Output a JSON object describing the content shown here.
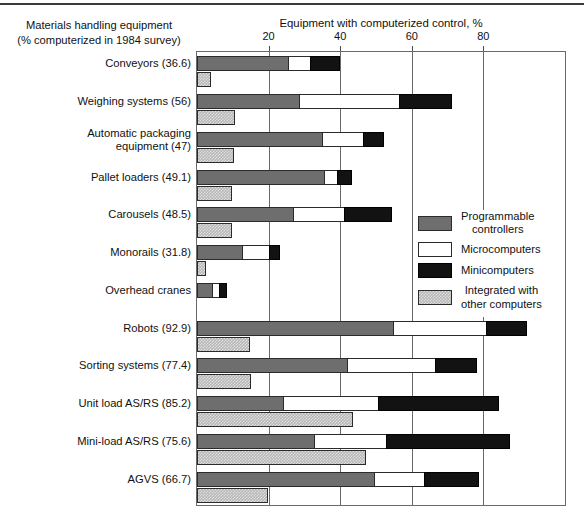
{
  "chart_data": {
    "type": "bar",
    "orientation": "horizontal",
    "stacked": true,
    "title": "",
    "xlabel": "Equipment with computerized control, %",
    "ylabel": "Materials handling equipment\n(% computerized in 1984 survey)",
    "ylabel_line1": "Materials handling equipment",
    "ylabel_line2": "(% computerized in 1984 survey)",
    "xlim": [
      0,
      102.8
    ],
    "xticks": [
      20,
      40,
      60,
      80
    ],
    "xticklabels": [
      "20",
      "40",
      "60",
      "80"
    ],
    "grid": true,
    "legend_position": "right-middle",
    "legend": [
      {
        "name": "Programmable controllers",
        "label_line1": "Programmable",
        "label_line2": "controllers",
        "color": "#6e6e6e",
        "swatch": "pc"
      },
      {
        "name": "Microcomputers",
        "label_line1": "Microcomputers",
        "label_line2": "",
        "color": "#ffffff",
        "swatch": "micro"
      },
      {
        "name": "Minicomputers",
        "label_line1": "Minicomputers",
        "label_line2": "",
        "color": "#121212",
        "swatch": "mini"
      },
      {
        "name": "Integrated with other computers",
        "label_line1": "Integrated with",
        "label_line2": "other computers",
        "color": "#b6b6b6",
        "swatch": "int"
      }
    ],
    "categories": [
      {
        "label_line1": "Conveyors (36.6)",
        "label_line2": "",
        "name": "Conveyors",
        "pct_computerized": 36.6
      },
      {
        "label_line1": "Weighing systems (56)",
        "label_line2": "",
        "name": "Weighing systems",
        "pct_computerized": 56
      },
      {
        "label_line1": "Automatic packaging",
        "label_line2": "equipment (47)",
        "name": "Automatic packaging equipment",
        "pct_computerized": 47
      },
      {
        "label_line1": "Pallet loaders (49.1)",
        "label_line2": "",
        "name": "Pallet loaders",
        "pct_computerized": 49.1
      },
      {
        "label_line1": "Carousels (48.5)",
        "label_line2": "",
        "name": "Carousels",
        "pct_computerized": 48.5
      },
      {
        "label_line1": "Monorails (31.8)",
        "label_line2": "",
        "name": "Monorails",
        "pct_computerized": 31.8
      },
      {
        "label_line1": "Overhead cranes",
        "label_line2": "",
        "name": "Overhead cranes",
        "pct_computerized": null
      },
      {
        "label_line1": "Robots (92.9)",
        "label_line2": "",
        "name": "Robots",
        "pct_computerized": 92.9
      },
      {
        "label_line1": "Sorting systems (77.4)",
        "label_line2": "",
        "name": "Sorting systems",
        "pct_computerized": 77.4
      },
      {
        "label_line1": "Unit load AS/RS (85.2)",
        "label_line2": "",
        "name": "Unit load AS/RS",
        "pct_computerized": 85.2
      },
      {
        "label_line1": "Mini-load AS/RS (75.6)",
        "label_line2": "",
        "name": "Mini-load AS/RS",
        "pct_computerized": 75.6
      },
      {
        "label_line1": "AGVS (66.7)",
        "label_line2": "",
        "name": "AGVS",
        "pct_computerized": 66.7
      }
    ],
    "series": [
      {
        "name": "Programmable controllers",
        "values": [
          25.8,
          28.9,
          35.3,
          35.8,
          27.2,
          12.8,
          4.4,
          55.0,
          42.2,
          24.2,
          33.1,
          49.7
        ]
      },
      {
        "name": "Microcomputers",
        "values": [
          6.1,
          27.8,
          11.4,
          3.6,
          14.2,
          7.5,
          1.9,
          26.1,
          24.7,
          26.7,
          20.0,
          13.9
        ]
      },
      {
        "name": "Minicomputers",
        "values": [
          8.1,
          14.4,
          5.6,
          3.9,
          13.1,
          2.8,
          2.2,
          11.1,
          11.4,
          33.6,
          34.4,
          15.3
        ]
      },
      {
        "name": "Integrated with other computers",
        "values": [
          3.3,
          10.0,
          9.7,
          9.2,
          9.2,
          1.9,
          0.0,
          14.2,
          14.4,
          43.1,
          46.7,
          19.2
        ]
      }
    ]
  }
}
